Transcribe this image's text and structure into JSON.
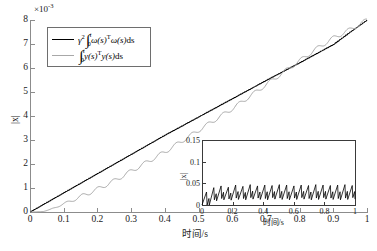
{
  "chart_data": {
    "type": "line",
    "title": "",
    "xlabel": "时间/s",
    "ylabel": "|x|",
    "y_exponent_label": "×10",
    "y_exponent_sup": "-3",
    "xlim": [
      0,
      1
    ],
    "ylim": [
      0,
      8
    ],
    "xticks": [
      "0",
      "0.1",
      "0.2",
      "0.3",
      "0.4",
      "0.5",
      "0.6",
      "0.7",
      "0.8",
      "0.9",
      "1"
    ],
    "xtick_values": [
      0,
      0.1,
      0.2,
      0.3,
      0.4,
      0.5,
      0.6,
      0.7,
      0.8,
      0.9,
      1
    ],
    "yticks": [
      "0",
      "1",
      "2",
      "3",
      "4",
      "5",
      "6",
      "7",
      "8"
    ],
    "ytick_values": [
      0,
      1,
      2,
      3,
      4,
      5,
      6,
      7,
      8
    ],
    "grid": false,
    "legend_position": "upper-left",
    "series": [
      {
        "name": "gamma-squared-omega-integral",
        "color": "#000000",
        "x": [
          0,
          0.02,
          0.05,
          0.08,
          0.12,
          0.16,
          0.2,
          0.25,
          0.3,
          0.35,
          0.4,
          0.45,
          0.5,
          0.55,
          0.6,
          0.65,
          0.7,
          0.75,
          0.8,
          0.85,
          0.9,
          0.95,
          1
        ],
        "values": [
          0,
          0.16,
          0.4,
          0.64,
          0.96,
          1.28,
          1.6,
          2.0,
          2.4,
          2.8,
          3.2,
          3.58,
          3.96,
          4.34,
          4.72,
          5.1,
          5.48,
          5.85,
          6.22,
          6.6,
          6.98,
          7.5,
          8.0
        ]
      },
      {
        "name": "y-integral",
        "color": "#a8a8a8",
        "x": [
          0,
          0.04,
          0.06,
          0.09,
          0.12,
          0.16,
          0.2,
          0.25,
          0.3,
          0.35,
          0.4,
          0.45,
          0.5,
          0.55,
          0.6,
          0.65,
          0.7,
          0.75,
          0.8,
          0.85,
          0.9,
          0.95,
          1
        ],
        "values": [
          0,
          0.02,
          0.1,
          0.28,
          0.45,
          0.7,
          0.95,
          1.3,
          1.7,
          2.1,
          2.5,
          2.95,
          3.4,
          3.85,
          4.3,
          4.8,
          5.3,
          5.8,
          6.3,
          6.8,
          7.25,
          7.6,
          8.0
        ]
      }
    ],
    "legend": [
      {
        "label": "gamma2-integral-omega-transpose-omega-ds",
        "color": "#000000"
      },
      {
        "label": "integral-y-transpose-y-ds",
        "color": "#a8a8a8"
      }
    ],
    "inset": {
      "type": "line",
      "xlabel": "时间/s",
      "ylabel": "|x|",
      "xlim": [
        0,
        1
      ],
      "ylim": [
        0,
        0.15
      ],
      "xticks": [
        "0",
        "0.2",
        "0.4",
        "0.6",
        "0.8",
        "1"
      ],
      "xtick_values": [
        0,
        0.2,
        0.4,
        0.6,
        0.8,
        1
      ],
      "yticks": [
        "0",
        "0.05",
        "0.1",
        "0.15"
      ],
      "ytick_values": [
        0,
        0.05,
        0.1,
        0.15
      ],
      "grid": false,
      "series": [
        {
          "name": "state-norm",
          "color": "#000000",
          "description": "sawtooth oscillation rising then dropping, amplitude about 0.045",
          "peaks": [
            0.03,
            0.04,
            0.044,
            0.041,
            0.046,
            0.043,
            0.047,
            0.044,
            0.046,
            0.045,
            0.047,
            0.046,
            0.044,
            0.046,
            0.045,
            0.047,
            0.046,
            0.045,
            0.046,
            0.047,
            0.045
          ],
          "troughs": [
            0.0,
            0.012,
            0.015,
            0.014,
            0.016,
            0.015,
            0.017,
            0.016,
            0.015,
            0.017,
            0.016,
            0.015,
            0.016,
            0.017,
            0.015,
            0.016,
            0.017,
            0.016,
            0.015,
            0.016,
            0.017
          ]
        }
      ]
    }
  },
  "legend_text": {
    "gamma": "γ",
    "gamma_sup": "2",
    "omega": "ω",
    "y": "y",
    "s": "(s)",
    "transpose": "T",
    "ds": "ds",
    "lower_limit": "0",
    "upper_limit": "t"
  }
}
